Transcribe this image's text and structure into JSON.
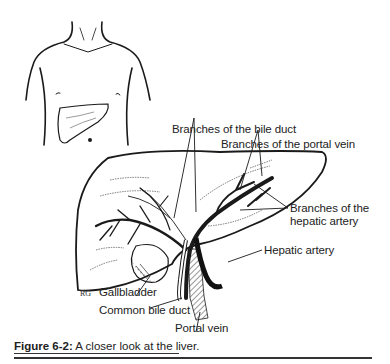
{
  "figure": {
    "number": "Figure 6-2:",
    "caption": " A closer look at the liver.",
    "artist_signature": "RG"
  },
  "labels": {
    "bile_duct_branches": "Branches of the bile duct",
    "portal_vein_branches": "Branches of the portal vein",
    "hepatic_artery_branches_line1": "Branches of the",
    "hepatic_artery_branches_line2": "hepatic artery",
    "hepatic_artery": "Hepatic artery",
    "gallbladder": "Gallbladder",
    "common_bile_duct": "Common bile duct",
    "portal_vein": "Portal vein"
  },
  "colors": {
    "ink": "#1a1a1a",
    "background": "#ffffff"
  }
}
